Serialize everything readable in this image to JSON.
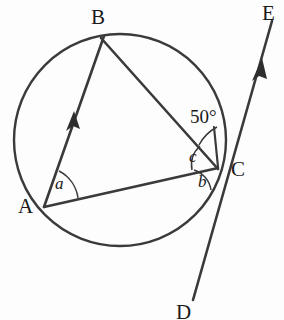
{
  "figure": {
    "type": "circle-geometry-diagram",
    "background_color": "#fdfdfd",
    "stroke_color": "#3a3a3a",
    "text_color": "#1a1a1a",
    "width": 284,
    "height": 320
  },
  "circle": {
    "name": "circle",
    "cx": 120,
    "cy": 140,
    "r": 106
  },
  "points": {
    "A": {
      "label": "A",
      "x": 44,
      "y": 207,
      "label_x": 18,
      "label_y": 204
    },
    "B": {
      "label": "B",
      "x": 101,
      "y": 38,
      "label_x": 91,
      "label_y": 8
    },
    "C": {
      "label": "C",
      "x": 216,
      "y": 168,
      "label_x": 231,
      "label_y": 160
    },
    "D": {
      "label": "D",
      "x": 195,
      "y": 300,
      "label_x": 176,
      "label_y": 303
    },
    "E": {
      "label": "E",
      "x": 270,
      "y": 24,
      "label_x": 262,
      "label_y": 3
    }
  },
  "segments": [
    {
      "name": "ray-a-to-b",
      "from": "A",
      "to": "B",
      "arrow": true,
      "arrow_at_fraction": 0.47
    },
    {
      "name": "chord-b-to-c",
      "from": "B",
      "to": "C",
      "arrow": false
    },
    {
      "name": "chord-a-to-c",
      "from": "A",
      "to": "C",
      "arrow": false
    },
    {
      "name": "tangent-d-to-e",
      "from": "D",
      "to": "E",
      "arrow": true,
      "arrow_at_fraction": 0.8
    }
  ],
  "angles": [
    {
      "name": "angle-a",
      "label": "a",
      "vertex": "A",
      "label_x": 55,
      "label_y": 176
    },
    {
      "name": "angle-b",
      "label": "b",
      "vertex": "C",
      "label_x": 198,
      "label_y": 174
    },
    {
      "name": "angle-c",
      "label": "c",
      "vertex": "C",
      "label_x": 189,
      "label_y": 150
    },
    {
      "name": "angle-50",
      "label": "50°",
      "vertex": "C",
      "label_x": 190,
      "label_y": 108
    }
  ],
  "paths": {
    "circle_d": "M 226 140 A 106 106 0 1 1 225.9 138.5",
    "ray_ab": "M 44 207 L 106 32",
    "chord_bc": "M 101 38 L 216 168",
    "chord_ac": "M 44 207 L 216 168",
    "tangent_de": "M 193 300 L 271 22",
    "arc_a": "M 75 196 A 33 33 0 0 0 62 172",
    "arc_b": "M 216 190 A 24 24 0 0 0 196 174",
    "arc_c": "M 195 173 A 27 27 0 0 1 206 146",
    "arc_50": "M 205 141 A 40 40 0 0 1 216 128",
    "tick_50": "M 214 128 L 219 170",
    "arrow_ab": "M 73 113 L 68 128 L 73 124 L 79 127 Z",
    "arrow_de": "M 260 62 L 254 79 L 259 75 L 265 78 Z"
  }
}
